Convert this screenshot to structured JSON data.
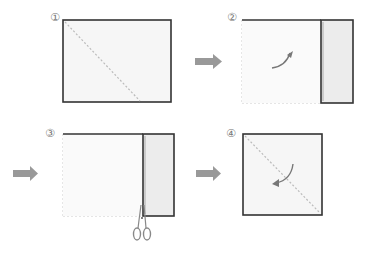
{
  "steps": [
    {
      "number": "①",
      "description": "Rectangle with diagonal dashed fold line"
    },
    {
      "number": "②",
      "description": "Fold right strip over, curved arrow"
    },
    {
      "number": "③",
      "description": "Cut along the fold with scissors"
    },
    {
      "number": "④",
      "description": "Square with diagonal dashed fold line, curved arrow"
    }
  ],
  "colors": {
    "outline": "#333333",
    "paper": "#f6f6f6",
    "strip": "#e8e8e8",
    "dashed": "#bbbbbb",
    "arrow": "#999999"
  },
  "icons": {
    "next_arrow": "right-arrow-icon",
    "scissors": "scissors-icon",
    "fold_arrow": "curved-arrow-icon"
  }
}
